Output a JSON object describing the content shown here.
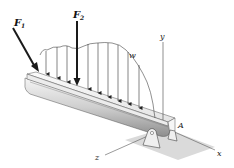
{
  "figure": {
    "type": "engineering-mechanics-beam",
    "labels": {
      "F1": {
        "main": "F",
        "sub": "1"
      },
      "F2": {
        "main": "F",
        "sub": "2"
      },
      "w": "w",
      "y": "y",
      "x": "x",
      "z": "z",
      "A": "A"
    },
    "colors": {
      "line": "#333333",
      "force_arrow": "#1a1a1a",
      "beam_light": "#f2f2f2",
      "beam_dark": "#9a9a9a",
      "ground_shadow": "#d6d6d6"
    },
    "distributed_load_arrow_count": 11
  }
}
